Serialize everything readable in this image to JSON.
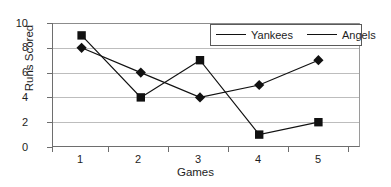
{
  "chart_data": {
    "type": "line",
    "title": "",
    "xlabel": "Games",
    "ylabel": "Runs Scored",
    "categories": [
      "1",
      "2",
      "3",
      "4",
      "5"
    ],
    "series": [
      {
        "name": "Yankees",
        "marker": "diamond",
        "color": "#111111",
        "values": [
          8,
          6,
          4,
          5,
          7
        ]
      },
      {
        "name": "Angels",
        "marker": "square",
        "color": "#111111",
        "values": [
          9,
          4,
          7,
          1,
          2
        ]
      }
    ],
    "ylim": [
      0,
      10
    ],
    "yticks": [
      0,
      2,
      4,
      6,
      8,
      10
    ],
    "grid": "horizontal",
    "legend_position": "top-right",
    "legend_entries": [
      "Yankees",
      "Angels"
    ]
  },
  "axes": {
    "y_title": "Runs Scored",
    "x_title": "Games",
    "y_tick_labels": [
      "10",
      "8",
      "6",
      "4",
      "2",
      "0"
    ],
    "x_tick_labels": [
      "1",
      "2",
      "3",
      "4",
      "5"
    ]
  },
  "legend": {
    "items": [
      {
        "label": "Yankees",
        "marker": "diamond-marker"
      },
      {
        "label": "Angels",
        "marker": "square-marker"
      }
    ]
  },
  "colors": {
    "series_line": "#111111",
    "gridline": "#bdbdbd",
    "axis": "#6e6e6e",
    "background": "#ffffff",
    "text": "#1d1d1d"
  }
}
